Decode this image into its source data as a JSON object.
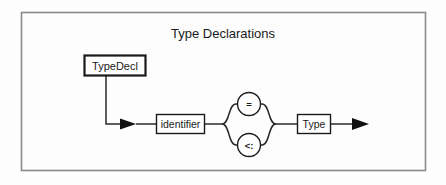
{
  "diagram": {
    "title": "Type Declarations",
    "type": "railroad-syntax-diagram",
    "frame": {
      "stroke_color": "#808080",
      "background": "#fdfdfd"
    },
    "nodes": {
      "start_nonterminal": {
        "label": "TypeDecl",
        "shape": "rectangle",
        "emphasis": "bold-border"
      },
      "identifier_box": {
        "label": "identifier",
        "shape": "rectangle"
      },
      "equals_circle": {
        "label": "=",
        "shape": "circle"
      },
      "subtype_circle": {
        "label": "<:",
        "shape": "circle"
      },
      "type_box": {
        "label": "Type",
        "shape": "rectangle"
      }
    },
    "edges": [
      {
        "name": "typedecl-to-entry",
        "from": "start_nonterminal",
        "to": "identifier_box",
        "arrow": true
      },
      {
        "name": "identifier-to-branch",
        "from": "identifier_box",
        "to": "branch-fork",
        "arrow": false
      },
      {
        "name": "branch-upper",
        "from": "branch-fork",
        "to": "equals_circle",
        "arrow": false
      },
      {
        "name": "branch-lower",
        "from": "branch-fork",
        "to": "subtype_circle",
        "arrow": false
      },
      {
        "name": "branch-merge",
        "from": "branch-merge",
        "to": "type_box",
        "arrow": false
      },
      {
        "name": "type-to-exit",
        "from": "type_box",
        "to": "exit",
        "arrow": true
      }
    ],
    "colors": {
      "ink": "#1a1a1a",
      "frame": "#808080",
      "line": "#2a2a2a"
    }
  }
}
